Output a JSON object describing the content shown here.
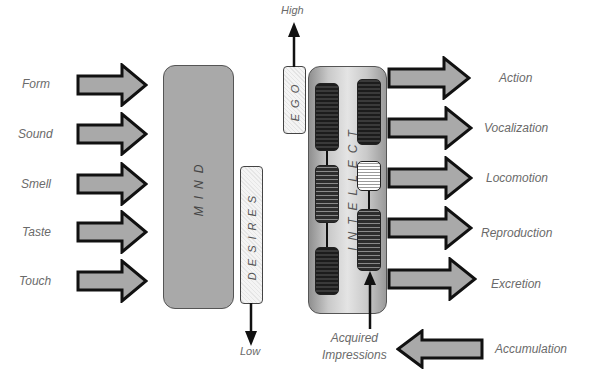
{
  "inputs": {
    "labels": [
      "Form",
      "Sound",
      "Smell",
      "Taste",
      "Touch"
    ],
    "arrow_color": "#a9a9a9"
  },
  "boxes": {
    "mind": "MIND",
    "desires": "DESIRES",
    "ego": "EGO",
    "intellect": "INTELLECT"
  },
  "scale": {
    "high": "High",
    "low": "Low"
  },
  "outputs": {
    "labels": [
      "Action",
      "Vocalization",
      "Locomotion",
      "Reproduction",
      "Excretion"
    ]
  },
  "feedback": {
    "source_label": "Accumulation",
    "target_label_line1": "Acquired",
    "target_label_line2": "Impressions"
  }
}
